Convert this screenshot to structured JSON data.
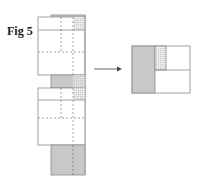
{
  "figure": {
    "title": "Fig 5"
  },
  "colors": {
    "outline": "#8a8a8a",
    "gray_fill": "#c8c8c8",
    "stipple_fill": "#e4e4e4",
    "arrow": "#444444"
  }
}
